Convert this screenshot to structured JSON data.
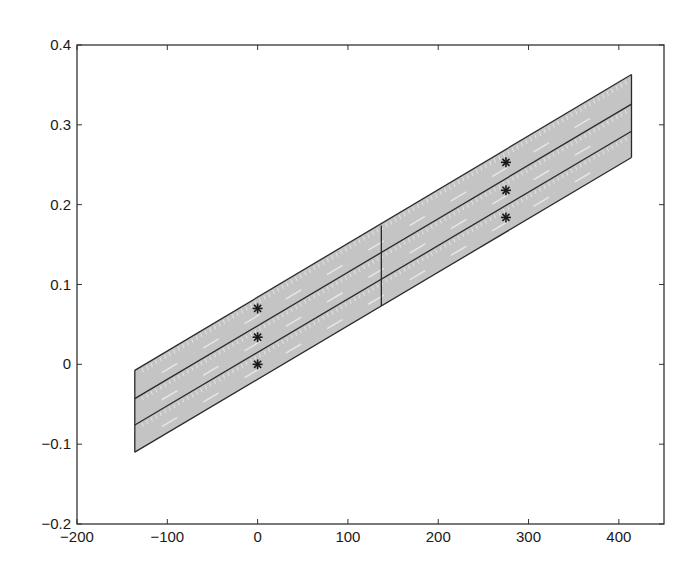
{
  "chart_data": {
    "type": "line",
    "title": "",
    "xlabel": "",
    "ylabel": "",
    "xlim": [
      -200,
      450
    ],
    "ylim": [
      -0.2,
      0.4
    ],
    "grid": false,
    "legend": null,
    "x_ticks": [
      -200,
      -100,
      0,
      100,
      200,
      300,
      400
    ],
    "x_tick_labels": [
      "−200",
      "−100",
      "0",
      "100",
      "200",
      "300",
      "400"
    ],
    "y_ticks": [
      -0.2,
      -0.1,
      0,
      0.1,
      0.2,
      0.3,
      0.4
    ],
    "y_tick_labels": [
      "−0.2",
      "−0.1",
      "0",
      "0.1",
      "0.2",
      "0.3",
      "0.4"
    ],
    "colors": {
      "band_fill": "#c4c4c4",
      "line": "#2a2a2a",
      "axis": "#333333",
      "marker": "#1a1a1a"
    },
    "band": {
      "x_left": -136,
      "x_mid": 137,
      "x_right": 414,
      "lines": [
        {
          "name": "upper-boundary",
          "y_left": -0.0075,
          "y_right": 0.363
        },
        {
          "name": "divider-1",
          "y_left": -0.043,
          "y_right": 0.326
        },
        {
          "name": "divider-2",
          "y_left": -0.076,
          "y_right": 0.292
        },
        {
          "name": "lower-boundary",
          "y_left": -0.11,
          "y_right": 0.259
        }
      ],
      "vertical_segments": [
        {
          "x": -136,
          "y_bottom": -0.11,
          "y_top": -0.0075
        },
        {
          "x": 137,
          "y_bottom": 0.073,
          "y_top": 0.174
        },
        {
          "x": 414,
          "y_bottom": 0.259,
          "y_top": 0.363
        }
      ]
    },
    "series": [
      {
        "name": "markers-left",
        "marker": "asterisk",
        "x": [
          0,
          0,
          0
        ],
        "y": [
          0.07,
          0.034,
          0.0
        ]
      },
      {
        "name": "markers-right",
        "marker": "asterisk",
        "x": [
          275,
          275,
          275
        ],
        "y": [
          0.253,
          0.218,
          0.184
        ]
      }
    ]
  }
}
